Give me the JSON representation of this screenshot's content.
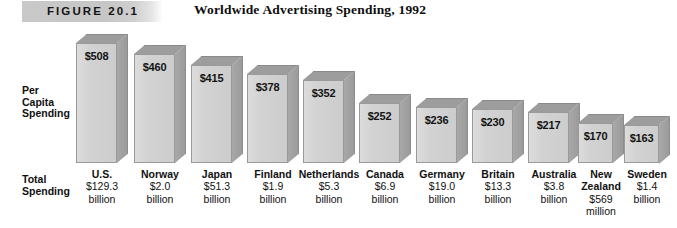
{
  "header": {
    "figure_banner": "FIGURE 20.1",
    "title": "Worldwide Advertising Spending, 1992"
  },
  "axis_labels": {
    "per_capita": "Per\nCapita\nSpending",
    "total": "Total\nSpending"
  },
  "chart_data": {
    "type": "bar",
    "title": "Worldwide Advertising Spending, 1992",
    "xlabel": "",
    "ylabel": "Per Capita Spending",
    "ylim": [
      0,
      560
    ],
    "grid": false,
    "legend": null,
    "categories": [
      "U.S.",
      "Norway",
      "Japan",
      "Finland",
      "Netherlands",
      "Canada",
      "Germany",
      "Britain",
      "Australia",
      "New\nZealand",
      "Sweden"
    ],
    "values": [
      508,
      460,
      415,
      378,
      352,
      252,
      236,
      230,
      217,
      170,
      163
    ],
    "value_labels": [
      "$508",
      "$460",
      "$415",
      "$378",
      "$352",
      "$252",
      "$236",
      "$230",
      "$217",
      "$170",
      "$163"
    ],
    "total_spending_labels": [
      "$129.3\nbillion",
      "$2.0\nbillion",
      "$51.3\nbillion",
      "$1.9\nbillion",
      "$5.3\nbillion",
      "$6.9\nbillion",
      "$19.0\nbillion",
      "$13.3\nbillion",
      "$3.8\nbillion",
      "$569\nmillion",
      "$1.4\nbillion"
    ]
  },
  "colors": {
    "bar_front": "#d4d4d4",
    "bar_top": "#9d9d9d",
    "bar_side": "#a0a0a0",
    "banner": "#c8c8c8",
    "text": "#111111"
  }
}
